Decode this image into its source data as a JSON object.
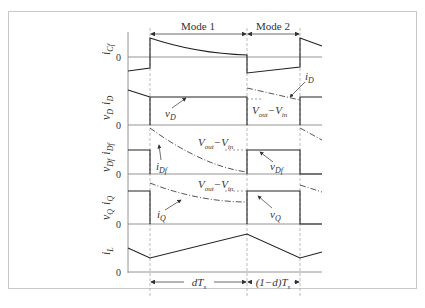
{
  "figure": {
    "modes": [
      {
        "label": "Mode 1"
      },
      {
        "label": "Mode 2"
      }
    ],
    "zero_label": "0",
    "rows": [
      {
        "id": "icf",
        "ylabel_main": "i",
        "ylabel_sub": "Cf"
      },
      {
        "id": "vd_id",
        "ylabel_main": "v",
        "ylabel_sub": "D",
        "ylabel2_main": "i",
        "ylabel2_sub": "D"
      },
      {
        "id": "vdf_idf",
        "ylabel_main": "v",
        "ylabel_sub": "Df",
        "ylabel2_main": "i",
        "ylabel2_sub": "Df"
      },
      {
        "id": "vq_iq",
        "ylabel_main": "v",
        "ylabel_sub": "Q",
        "ylabel2_main": "i",
        "ylabel2_sub": "Q"
      },
      {
        "id": "il",
        "ylabel_main": "i",
        "ylabel_sub": "L"
      }
    ],
    "annotations": {
      "iD": {
        "main": "i",
        "sub": "D"
      },
      "vD": {
        "main": "v",
        "sub": "D"
      },
      "vout_vin_1": {
        "a": "V",
        "a_sub": "out",
        "dash": "−",
        "b": "V",
        "b_sub": "in"
      },
      "iDf": {
        "main": "i",
        "sub": "Df"
      },
      "vDf": {
        "main": "v",
        "sub": "Df"
      },
      "iQ": {
        "main": "i",
        "sub": "Q"
      },
      "vQ": {
        "main": "v",
        "sub": "Q"
      }
    },
    "time_intervals": [
      {
        "label_pre": "d",
        "label_T": "T",
        "label_sub": "s"
      },
      {
        "label_pre": "(1−d)",
        "label_T": "T",
        "label_sub": "s"
      }
    ],
    "colors": {
      "trace": "#222222",
      "axis": "#888888",
      "dashed": "#999999",
      "frame": "#c8c8c8"
    }
  }
}
